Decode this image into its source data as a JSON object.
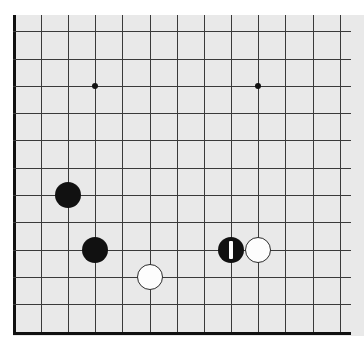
{
  "board": {
    "title": "Go board position",
    "type": "go-goban",
    "background_color": "#e9e9e9",
    "page_background_color": "#ffffff",
    "line_color": "#3a3a3a",
    "border_color": "#111111",
    "surface": {
      "left": 13,
      "top": 15,
      "width": 351,
      "height": 321
    },
    "grid": {
      "spacing": 27.2,
      "line_thickness": 1,
      "border_thickness": 3,
      "visible_columns": 13,
      "visible_rows": 12,
      "x_positions": [
        14,
        41,
        68,
        95,
        122,
        150,
        177,
        204,
        231,
        258,
        285,
        313,
        340
      ],
      "y_positions": [
        31,
        59,
        86,
        113,
        140,
        168,
        195,
        222,
        250,
        277,
        304,
        332
      ],
      "left_border_x": 14,
      "bottom_border_y": 332,
      "vertical_lines_top": 15,
      "vertical_lines_bottom": 334,
      "horizontal_lines_left": 13,
      "horizontal_lines_right": 351,
      "cropped_edges": [
        "top",
        "right"
      ]
    },
    "star_points": [
      {
        "name": "star-point-left",
        "x": 95,
        "y": 86,
        "radius": 3
      },
      {
        "name": "star-point-right",
        "x": 258,
        "y": 86,
        "radius": 3
      }
    ],
    "stone_diameter": 26,
    "stones": [
      {
        "name": "black-stone-upper-left",
        "color": "black",
        "x": 68,
        "y": 195,
        "marked": false
      },
      {
        "name": "black-stone-lower-left",
        "color": "black",
        "x": 95,
        "y": 250,
        "marked": false
      },
      {
        "name": "white-stone-lower-center",
        "color": "white",
        "x": 150,
        "y": 277,
        "marked": false
      },
      {
        "name": "black-stone-marked-right",
        "color": "black",
        "x": 231,
        "y": 250,
        "marked": true,
        "marker": "vertical-bar",
        "marker_color": "#ffffff",
        "marker_width": 4,
        "marker_height": 18
      },
      {
        "name": "white-stone-right",
        "color": "white",
        "x": 258,
        "y": 250,
        "marked": false
      }
    ],
    "stone_counts": {
      "black": 3,
      "white": 2,
      "total": 5
    },
    "last_move": {
      "color": "black",
      "x": 231,
      "y": 250
    }
  }
}
